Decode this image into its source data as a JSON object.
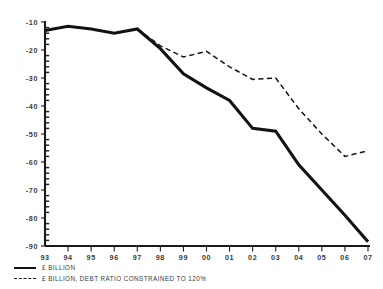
{
  "chart_data": {
    "type": "line",
    "title": "",
    "subtitle": "",
    "xlabel": "",
    "ylabel": "",
    "x": [
      "93",
      "94",
      "95",
      "96",
      "97",
      "98",
      "99",
      "00",
      "01",
      "02",
      "03",
      "04",
      "05",
      "06",
      "07"
    ],
    "xlim": [
      0,
      14
    ],
    "ylim": [
      -90,
      -10
    ],
    "yticks": [
      -10,
      -20,
      -30,
      -40,
      -50,
      -60,
      -70,
      -80,
      -90
    ],
    "ytick_labels": [
      "-10",
      "-20",
      "-30",
      "-40",
      "-50",
      "-60",
      "-70",
      "-80",
      "-90"
    ],
    "xtick_labels": [
      "93",
      "94",
      "95",
      "96",
      "97",
      "98",
      "99",
      "00",
      "01",
      "02",
      "03",
      "04",
      "05",
      "06",
      "07"
    ],
    "grid": false,
    "legend_position": "below-left",
    "series": [
      {
        "name": "£ BILLION",
        "style": "solid",
        "color": "#121212",
        "x": [
          "93",
          "94",
          "95",
          "96",
          "97",
          "98",
          "99",
          "00",
          "01",
          "02",
          "03",
          "04",
          "05",
          "06",
          "07"
        ],
        "values": [
          -13.0,
          -11.5,
          -12.5,
          -14.0,
          -12.5,
          -19.5,
          -28.5,
          -33.5,
          -38.0,
          -48.0,
          -49.0,
          -61.0,
          -70.0,
          -79.0,
          -88.5
        ]
      },
      {
        "name": "£ BILLION, DEBT RATIO CONSTRAINED TO 120%",
        "style": "dashed",
        "color": "#141414",
        "x": [
          "97",
          "98",
          "99",
          "00",
          "01",
          "02",
          "03",
          "04",
          "05",
          "06",
          "07"
        ],
        "values": [
          -12.5,
          -18.5,
          -22.5,
          -20.5,
          -26.0,
          -30.5,
          -30.0,
          -41.0,
          -50.0,
          -58.0,
          -56.0
        ]
      }
    ]
  },
  "legend": {
    "items": [
      {
        "label": "£ BILLION",
        "style": "solid"
      },
      {
        "label": "£ BILLION, DEBT RATIO CONSTRAINED TO 120%",
        "style": "dashed"
      }
    ]
  }
}
